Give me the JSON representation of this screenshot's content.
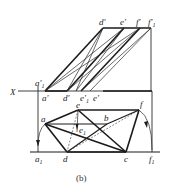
{
  "figure": {
    "caption": "(b)",
    "axis_label": "X",
    "labels": {
      "d_prime": "d'",
      "e_prime_top": "e'",
      "f_prime": "f'",
      "f1_prime": "f'",
      "f1_prime_sub": "1",
      "a1_prime": "a'",
      "a1_prime_sub": "1",
      "a_prime": "a'",
      "d_prime_bottom": "d'",
      "e1_prime": "e'",
      "e1_prime_sub": "1",
      "e_prime_bottom": "e'",
      "a": "a",
      "e": "e",
      "b": "b",
      "f": "f",
      "e1": "e",
      "e1_sub": "1",
      "a1": "a",
      "a1_sub": "1",
      "d": "d",
      "c": "c",
      "f1": "f",
      "f1_sub": "1"
    }
  }
}
